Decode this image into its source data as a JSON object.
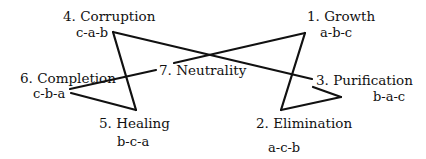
{
  "diagram": {
    "nodes": [
      {
        "id": 1,
        "label": "1. Growth",
        "sequence": "a-b-c"
      },
      {
        "id": 2,
        "label": "2. Elimination",
        "sequence": "a-c-b"
      },
      {
        "id": 3,
        "label": "3. Purification",
        "sequence": "b-a-c"
      },
      {
        "id": 4,
        "label": "4. Corruption",
        "sequence": "c-a-b"
      },
      {
        "id": 5,
        "label": "5. Healing",
        "sequence": "b-c-a"
      },
      {
        "id": 6,
        "label": "6. Completion",
        "sequence": "c-b-a"
      },
      {
        "id": 7,
        "label": "7. Neutrality",
        "sequence": ""
      }
    ],
    "line_color": "#111111"
  }
}
